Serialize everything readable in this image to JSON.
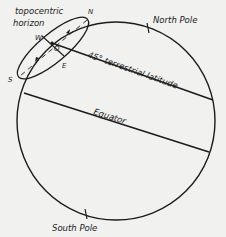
{
  "diagram": {
    "labels": {
      "horizon_line1": "topocentric",
      "horizon_line2": "horizon",
      "north_marker": "N",
      "south_marker": "S",
      "west_marker": "W",
      "east_marker": "E",
      "observer_marker": "O",
      "north_pole": "North Pole",
      "south_pole": "South Pole",
      "latitude": "45° terrestrial latitude",
      "equator": "Equator"
    },
    "colors": {
      "ink": "#1b1b1b",
      "background": "#f1f1ef"
    }
  }
}
